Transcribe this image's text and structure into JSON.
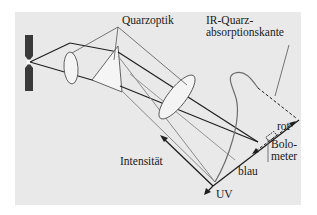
{
  "diagram": {
    "type": "prism-spectrometer-schematic",
    "labels": {
      "quarzoptik": "Quarzoptik",
      "ir_line1": "IR-Quarz-",
      "ir_line2": "absorptionskante",
      "rot": "rot",
      "bolo_line1": "Bolo-",
      "bolo_line2": "meter",
      "intensitaet": "Intensität",
      "blau": "blau",
      "uv": "UV"
    },
    "components": [
      "slit",
      "collimator-lens",
      "quartz-prism",
      "focusing-lens",
      "spectrum-plane",
      "bolometer",
      "intensity-curve"
    ],
    "colors": {
      "panel": "#e9e9e9",
      "dark_line": "#1f1f1f",
      "gray_line": "#8a8a8a",
      "optic_fill": "#f4f4f4",
      "slit": "#3a3a3a"
    }
  }
}
